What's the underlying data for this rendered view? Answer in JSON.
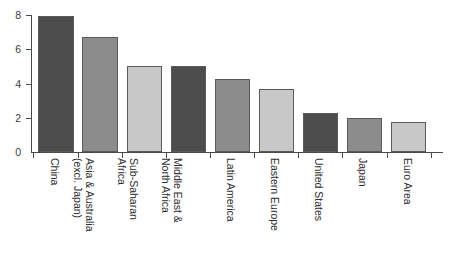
{
  "chart_data": {
    "type": "bar",
    "title": "",
    "subtitle": "",
    "xlabel": "",
    "ylabel": "",
    "ylim": [
      0,
      8
    ],
    "yticks": [
      0,
      2,
      4,
      6,
      8
    ],
    "ytick_labels": [
      "0",
      "2",
      "4",
      "6",
      "8"
    ],
    "grid": false,
    "legend": "none",
    "orientation": "vertical",
    "xtick_label_rotation": 90,
    "categories": [
      "China",
      "Asia & Australia\n(excl. Japan)",
      "Sub-Saharan\nAfrica",
      "Middle East &\nNorth Africa",
      "Latin America",
      "Eastern Europe",
      "United States",
      "Japan",
      "Euro Area"
    ],
    "values": [
      7.95,
      6.7,
      5.0,
      5.0,
      4.25,
      3.7,
      2.25,
      2.0,
      1.75
    ],
    "bar_colors": [
      "#4d4d4d",
      "#8c8c8c",
      "#c8c8c8",
      "#4d4d4d",
      "#8c8c8c",
      "#c8c8c8",
      "#4d4d4d",
      "#8c8c8c",
      "#c8c8c8"
    ],
    "bar_edge_color": "#5a5a5a",
    "axis_color": "#4a4a4a",
    "background": "#ffffff"
  }
}
